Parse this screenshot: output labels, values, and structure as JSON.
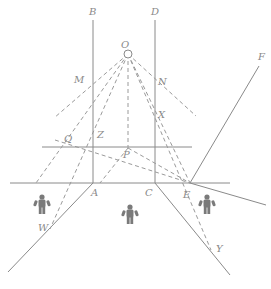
{
  "diagram": {
    "colors": {
      "line": "#8a8a8a",
      "dash": "#9a9a9a",
      "person": "#7a7a7a",
      "background": "#ffffff"
    },
    "labels": {
      "B": {
        "text": "B",
        "x": 89,
        "y": 15
      },
      "D": {
        "text": "D",
        "x": 151,
        "y": 15
      },
      "O": {
        "text": "O",
        "x": 121,
        "y": 48
      },
      "M": {
        "text": "M",
        "x": 74,
        "y": 83
      },
      "N": {
        "text": "N",
        "x": 158,
        "y": 85
      },
      "X": {
        "text": "X",
        "x": 158,
        "y": 118
      },
      "Z": {
        "text": "Z",
        "x": 97,
        "y": 138
      },
      "Q": {
        "text": "Q",
        "x": 64,
        "y": 142
      },
      "P": {
        "text": "P",
        "x": 123,
        "y": 158
      },
      "F": {
        "text": "F",
        "x": 258,
        "y": 60
      },
      "A": {
        "text": "A",
        "x": 91,
        "y": 196
      },
      "C": {
        "text": "C",
        "x": 145,
        "y": 196
      },
      "E": {
        "text": "E",
        "x": 183,
        "y": 198
      },
      "W": {
        "text": "W",
        "x": 38,
        "y": 231
      },
      "Y": {
        "text": "Y",
        "x": 216,
        "y": 252
      }
    },
    "eye": {
      "x": 128,
      "y": 54,
      "r": 4
    },
    "solid_lines": [
      {
        "name": "mirror-AB",
        "x1": 93,
        "y1": 20,
        "x2": 93,
        "y2": 183
      },
      {
        "name": "mirror-CD",
        "x1": 155,
        "y1": 20,
        "x2": 155,
        "y2": 183
      },
      {
        "name": "ground-line",
        "x1": 10,
        "y1": 183,
        "x2": 230,
        "y2": 183
      },
      {
        "name": "upper-horizontal",
        "x1": 42,
        "y1": 147,
        "x2": 192,
        "y2": 147
      },
      {
        "name": "wall-A-down",
        "x1": 93,
        "y1": 183,
        "x2": 8,
        "y2": 272
      },
      {
        "name": "wall-C-down",
        "x1": 155,
        "y1": 183,
        "x2": 230,
        "y2": 275
      },
      {
        "name": "line-EF",
        "x1": 190,
        "y1": 183,
        "x2": 259,
        "y2": 66
      },
      {
        "name": "line-E-right",
        "x1": 190,
        "y1": 183,
        "x2": 266,
        "y2": 205
      }
    ],
    "dashed_lines": [
      {
        "name": "O-M-ray",
        "x1": 128,
        "y1": 54,
        "x2": 54,
        "y2": 118
      },
      {
        "name": "O-N-ray",
        "x1": 128,
        "y1": 54,
        "x2": 196,
        "y2": 116
      },
      {
        "name": "O-Z-ray",
        "x1": 128,
        "y1": 54,
        "x2": 36,
        "y2": 183
      },
      {
        "name": "O-W-ray",
        "x1": 128,
        "y1": 54,
        "x2": 50,
        "y2": 229
      },
      {
        "name": "O-P-vertical",
        "x1": 128,
        "y1": 54,
        "x2": 128,
        "y2": 148
      },
      {
        "name": "O-X-ray",
        "x1": 128,
        "y1": 54,
        "x2": 190,
        "y2": 183
      },
      {
        "name": "O-Y-ray",
        "x1": 128,
        "y1": 54,
        "x2": 211,
        "y2": 250
      },
      {
        "name": "Q-E-line",
        "x1": 55,
        "y1": 140,
        "x2": 190,
        "y2": 183
      },
      {
        "name": "P-left",
        "x1": 128,
        "y1": 148,
        "x2": 100,
        "y2": 183
      },
      {
        "name": "P-E",
        "x1": 128,
        "y1": 148,
        "x2": 190,
        "y2": 183
      }
    ],
    "people": [
      {
        "name": "person-left",
        "x": 42,
        "y": 205
      },
      {
        "name": "person-center",
        "x": 130,
        "y": 215
      },
      {
        "name": "person-right",
        "x": 207,
        "y": 205
      }
    ]
  }
}
